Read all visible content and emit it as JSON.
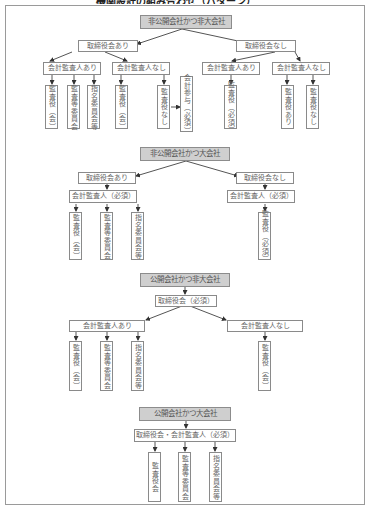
{
  "title": "機関設計の組み合わせ（パターン）",
  "sections": [
    {
      "head": "非公開会社かつ非大会社",
      "level1": [
        "取締役会あり",
        "取締役会なし"
      ],
      "level2": [
        "会計監査人あり",
        "会計監査人なし",
        "会計監査人あり",
        "会計監査人なし"
      ],
      "leaves": [
        "監査役（会）",
        "監査等委員会",
        "指名委員会等",
        "監査役（会）",
        "監査役なし",
        "会計参与（必須）",
        "監査役（必須）",
        "監査役あり",
        "監査役なし"
      ]
    },
    {
      "head": "非公開会社かつ大会社",
      "level1": [
        "取締役会あり",
        "取締役会なし"
      ],
      "level2": [
        "会計監査人（必須）",
        "会計監査人（必須）"
      ],
      "leaves": [
        "監査役（会）",
        "監査等委員会",
        "指名委員会等",
        "監査役（必須）"
      ]
    },
    {
      "head": "公開会社かつ非大会社",
      "level1": [
        "取締役会（必須）"
      ],
      "level2": [
        "会計監査人あり",
        "会計監査人なし"
      ],
      "leaves": [
        "監査役（会）",
        "監査等委員会",
        "指名委員会等",
        "監査役（会）"
      ]
    },
    {
      "head": "公開会社かつ大会社",
      "level1": [
        "取締役会・会計監査人（必須）"
      ],
      "leaves": [
        "監査役会",
        "監査等委員会",
        "指名委員会等"
      ]
    }
  ]
}
